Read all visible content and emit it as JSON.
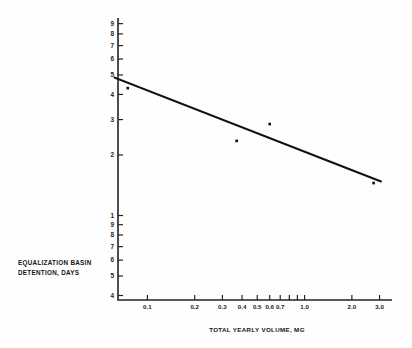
{
  "chart_data": {
    "type": "scatter",
    "title": "",
    "xlabel": "TOTAL YEARLY VOLUME, MG",
    "ylabel": "EQUALIZATION BASIN DETENTION, DAYS",
    "xscale": "log",
    "yscale": "log",
    "xlim": [
      0.065,
      3.6
    ],
    "ylim": [
      0.38,
      9.6
    ],
    "grid": false,
    "legend": null,
    "x_ticks": [
      {
        "value": 0.1,
        "label": "0.1"
      },
      {
        "value": 0.2,
        "label": "0.2"
      },
      {
        "value": 0.3,
        "label": "0.3"
      },
      {
        "value": 0.4,
        "label": "0.4"
      },
      {
        "value": 0.5,
        "label": "0.5"
      },
      {
        "value": 0.6,
        "label": "0.6"
      },
      {
        "value": 0.7,
        "label": "0.7"
      },
      {
        "value": 0.8,
        "label": ""
      },
      {
        "value": 0.9,
        "label": ""
      },
      {
        "value": 1.0,
        "label": "1.0"
      },
      {
        "value": 2.0,
        "label": "2.0"
      },
      {
        "value": 3.0,
        "label": "3.0"
      }
    ],
    "y_ticks": [
      {
        "value": 9,
        "label": "9"
      },
      {
        "value": 8,
        "label": "8"
      },
      {
        "value": 7,
        "label": "7"
      },
      {
        "value": 6,
        "label": "6"
      },
      {
        "value": 5,
        "label": "5"
      },
      {
        "value": 4,
        "label": "4"
      },
      {
        "value": 3,
        "label": "3"
      },
      {
        "value": 2,
        "label": "2"
      },
      {
        "value": 1,
        "label": "1"
      },
      {
        "value": 0.9,
        "label": "9"
      },
      {
        "value": 0.8,
        "label": "8"
      },
      {
        "value": 0.7,
        "label": "7"
      },
      {
        "value": 0.6,
        "label": "6"
      },
      {
        "value": 0.5,
        "label": "5"
      },
      {
        "value": 0.4,
        "label": "4"
      }
    ],
    "points": [
      {
        "x": 0.075,
        "y": 4.3
      },
      {
        "x": 0.37,
        "y": 2.35
      },
      {
        "x": 0.6,
        "y": 2.85
      },
      {
        "x": 2.75,
        "y": 1.45
      }
    ],
    "trendline": {
      "x1": 0.062,
      "y1": 4.85,
      "x2": 3.05,
      "y2": 1.48
    }
  },
  "colors": {
    "ink": "#1a1a1a",
    "background": "#fefefe",
    "axis": "#222222",
    "line": "#111111",
    "marker": "#0d0d0d"
  }
}
